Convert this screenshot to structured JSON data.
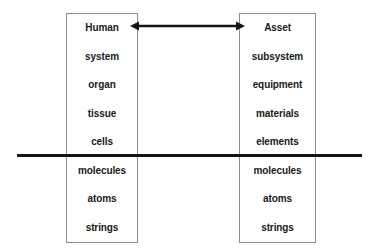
{
  "diagram": {
    "type": "two-column-hierarchy-comparison",
    "background_color": "#ffffff",
    "text_color": "#1a1a1a",
    "box_border_color": "#8c8c8c",
    "rule_color": "#141414",
    "columns": [
      {
        "id": "human",
        "header": "Human",
        "levels": [
          {
            "label": "Human"
          },
          {
            "label": "system"
          },
          {
            "label": "organ"
          },
          {
            "label": "tissue"
          },
          {
            "label": "cells"
          },
          {
            "label": "molecules"
          },
          {
            "label": "atoms"
          },
          {
            "label": "strings"
          }
        ]
      },
      {
        "id": "asset",
        "header": "Asset",
        "levels": [
          {
            "label": "Asset"
          },
          {
            "label": "subsystem"
          },
          {
            "label": "equipment"
          },
          {
            "label": "materials"
          },
          {
            "label": "elements"
          },
          {
            "label": "molecules"
          },
          {
            "label": "atoms"
          },
          {
            "label": "strings"
          }
        ]
      }
    ],
    "connector": {
      "name": "double-headed-arrow",
      "from": "Human",
      "to": "Asset",
      "style": "bidirectional"
    },
    "divider": {
      "name": "horizontal-boundary-line",
      "position_after_level": 5,
      "spans": "full-width"
    }
  }
}
